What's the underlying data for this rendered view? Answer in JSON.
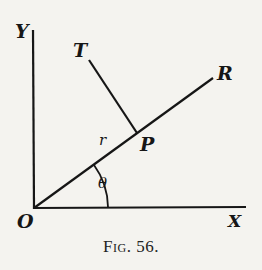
{
  "figure": {
    "caption": "Fig. 56.",
    "caption_prefix": "Fig.",
    "caption_number": "56."
  },
  "labels": {
    "y_axis": "Y",
    "x_axis": "X",
    "origin": "O",
    "tangent": "T",
    "radial": "R",
    "point": "P",
    "radius": "r",
    "angle": "θ"
  },
  "colors": {
    "ink": "#161616",
    "paper": "#f4f3ef"
  },
  "geometry": {
    "origin": [
      34,
      208
    ],
    "y_axis_top": [
      33,
      30
    ],
    "x_axis_end": [
      245,
      207
    ],
    "radial_end_R": [
      213,
      78
    ],
    "point_P": [
      137,
      133
    ],
    "tangent_end_T": [
      89,
      60
    ],
    "angle_arc_radius": 74
  }
}
